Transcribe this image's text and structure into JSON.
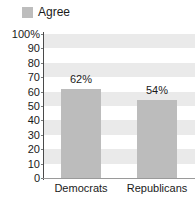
{
  "legend": {
    "swatch_name": "legend-color-swatch",
    "label": "Agree",
    "color": "#bdbdbd"
  },
  "axis": {
    "y_ticks": [
      "100%",
      "90",
      "80",
      "70",
      "60",
      "50",
      "40",
      "30",
      "20",
      "10",
      "0"
    ],
    "y_tick_values": [
      100,
      90,
      80,
      70,
      60,
      50,
      40,
      30,
      20,
      10,
      0
    ]
  },
  "colors": {
    "bar_fill": "#bcbcbc",
    "band_fill": "#eaeaea",
    "axis_line": "#4a4a4a",
    "text": "#1a1a1a",
    "background": "#ffffff"
  },
  "chart_data": {
    "type": "bar",
    "title": "",
    "subtitle": "",
    "xlabel": "",
    "ylabel": "",
    "categories": [
      "Democrats",
      "Republicans"
    ],
    "values": [
      62,
      54
    ],
    "value_labels": [
      "62%",
      "54%"
    ],
    "series": [
      {
        "name": "Agree",
        "values": [
          62,
          54
        ],
        "color": "#bcbcbc"
      }
    ],
    "ylim": [
      0,
      100
    ],
    "y_ticks": [
      0,
      10,
      20,
      30,
      40,
      50,
      60,
      70,
      80,
      90,
      100
    ],
    "y_tick_labels": [
      "0",
      "10",
      "20",
      "30",
      "40",
      "50",
      "60",
      "70",
      "80",
      "90",
      "100%"
    ],
    "grid": false,
    "banded_background": true,
    "band_interval": 20,
    "legend": [
      "Agree"
    ],
    "legend_position": "top-left",
    "annotations": [
      "62%",
      "54%"
    ]
  }
}
